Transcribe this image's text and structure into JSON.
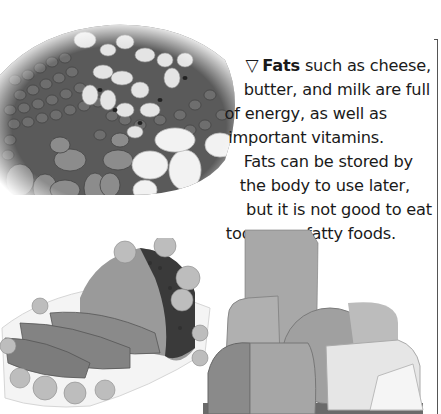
{
  "caption": {
    "marker": "▽",
    "bold_term": "Fats",
    "lines": [
      " such as cheese,",
      "butter, and milk are full",
      "of energy, as well as",
      "important vitamins.",
      "Fats can be stored by",
      "the body to use later,",
      "but it is not good to eat",
      "too many fatty foods."
    ]
  },
  "images": {
    "beans": "Mixed beans photo",
    "ham": "Roast ham with sliced pieces on a plate",
    "cheese": "Assorted cheeses"
  },
  "colors": {
    "text": "#1a1a1a",
    "background": "#ffffff",
    "frame": "#555555"
  }
}
